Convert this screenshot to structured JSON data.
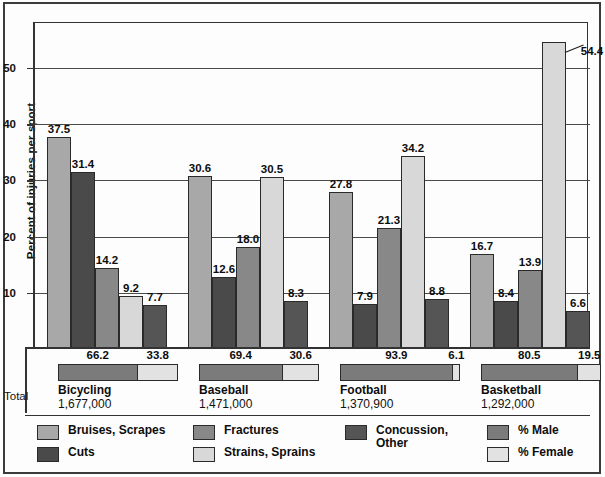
{
  "chart_data": {
    "type": "bar",
    "title": "",
    "xlabel": "",
    "ylabel": "Percent of injuries per sport",
    "ylim": [
      0,
      58
    ],
    "yticks": [
      10,
      20,
      30,
      40,
      50
    ],
    "ytick_labels": [
      "10",
      "20",
      "30",
      "40",
      "50"
    ],
    "grid": true,
    "legend_position": "bottom",
    "categories": [
      "Bicycling",
      "Baseball",
      "Football",
      "Basketball"
    ],
    "series": [
      {
        "name": "Bruises, Scrapes",
        "color": "#a8a8a8",
        "values": [
          37.5,
          30.6,
          27.8,
          16.7
        ]
      },
      {
        "name": "Cuts",
        "color": "#4a4a4a",
        "values": [
          31.4,
          12.6,
          7.9,
          8.4
        ]
      },
      {
        "name": "Fractures",
        "color": "#888888",
        "values": [
          14.2,
          18.0,
          21.3,
          13.9
        ]
      },
      {
        "name": "Strains, Sprains",
        "color": "#d8d8d8",
        "values": [
          9.2,
          30.5,
          34.2,
          54.4
        ]
      },
      {
        "name": "Concussion,\nOther",
        "color": "#555555",
        "values": [
          7.7,
          8.3,
          8.8,
          6.6
        ]
      }
    ],
    "bar_labels": [
      [
        "37.5",
        "31.4",
        "14.2",
        "9.2",
        "7.7"
      ],
      [
        "30.6",
        "12.6",
        "18.0",
        "30.5",
        "8.3"
      ],
      [
        "27.8",
        "7.9",
        "21.3",
        "34.2",
        "8.8"
      ],
      [
        "16.7",
        "8.4",
        "13.9",
        "54.4",
        "6.6"
      ]
    ]
  },
  "totals": {
    "row_label": "Total",
    "male_legend": "% Male",
    "female_legend": "% Female",
    "male_color": "#7b7b7b",
    "female_color": "#e2e2e2",
    "sports": [
      {
        "name": "Bicycling",
        "total": "1,677,000",
        "male": "66.2",
        "female": "33.8",
        "male_value": 66.2,
        "female_value": 33.8
      },
      {
        "name": "Baseball",
        "total": "1,471,000",
        "male": "69.4",
        "female": "30.6",
        "male_value": 69.4,
        "female_value": 30.6
      },
      {
        "name": "Football",
        "total": "1,370,900",
        "male": "93.9",
        "female": "6.1",
        "male_value": 93.9,
        "female_value": 6.1
      },
      {
        "name": "Basketball",
        "total": "1,292,000",
        "male": "80.5",
        "female": "19.5",
        "male_value": 80.5,
        "female_value": 19.5
      }
    ]
  },
  "legend": {
    "items": [
      {
        "label": "Bruises, Scrapes",
        "color": "#a8a8a8",
        "name": "bruises-scrapes"
      },
      {
        "label": "Cuts",
        "color": "#4a4a4a",
        "name": "cuts"
      },
      {
        "label": "Fractures",
        "color": "#888888",
        "name": "fractures"
      },
      {
        "label": "Strains, Sprains",
        "color": "#d8d8d8",
        "name": "strains-sprains"
      },
      {
        "label": "Concussion,\nOther",
        "color": "#555555",
        "name": "concussion-other"
      },
      {
        "label": "% Male",
        "color": "#7b7b7b",
        "name": "percent-male"
      },
      {
        "label": "% Female",
        "color": "#e2e2e2",
        "name": "percent-female"
      }
    ]
  }
}
